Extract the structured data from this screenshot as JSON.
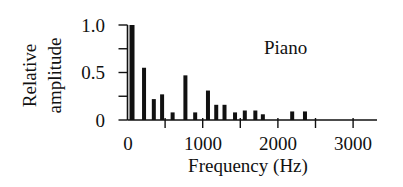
{
  "chart_data": {
    "type": "bar",
    "title": "",
    "annotation": "Piano",
    "xlabel": "Frequency (Hz)",
    "ylabel": [
      "Relative",
      "amplitude"
    ],
    "xlim": [
      0,
      3300
    ],
    "ylim": [
      0,
      1.0
    ],
    "x_ticks": [
      0,
      500,
      1000,
      1500,
      2000,
      2500,
      3000
    ],
    "x_tick_labels": [
      "0",
      "",
      "1000",
      "",
      "2000",
      "",
      "3000"
    ],
    "y_ticks": [
      0,
      0.25,
      0.5,
      0.75,
      1.0
    ],
    "y_tick_labels": [
      "0",
      "",
      "0.5",
      "",
      "1.0"
    ],
    "grid": false,
    "legend": null,
    "x": [
      60,
      220,
      350,
      460,
      600,
      770,
      900,
      1070,
      1180,
      1290,
      1430,
      1560,
      1700,
      1800,
      2190,
      2360
    ],
    "values": [
      1.0,
      0.55,
      0.22,
      0.27,
      0.08,
      0.47,
      0.08,
      0.31,
      0.16,
      0.16,
      0.08,
      0.1,
      0.1,
      0.06,
      0.09,
      0.09
    ],
    "bar_color": "#111111"
  }
}
